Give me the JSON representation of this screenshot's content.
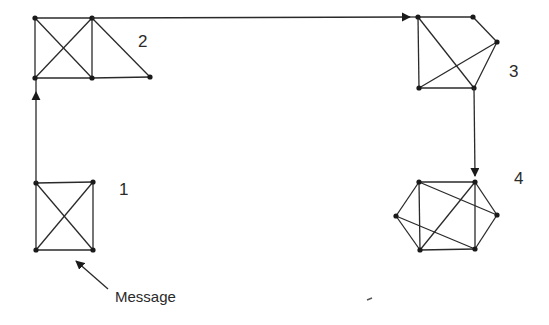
{
  "diagram": {
    "clusters": [
      {
        "id": "1",
        "label": "1",
        "label_pos": [
          119,
          181
        ]
      },
      {
        "id": "2",
        "label": "2",
        "label_pos": [
          138,
          33
        ]
      },
      {
        "id": "3",
        "label": "3",
        "label_pos": [
          509,
          63
        ]
      },
      {
        "id": "4",
        "label": "4",
        "label_pos": [
          514,
          170
        ]
      }
    ],
    "annotation": {
      "text": "Message",
      "pos": [
        115,
        288
      ]
    },
    "colors": {
      "line": "#2a2a2a",
      "node": "#1a1a1a",
      "background": "#ffffff"
    }
  }
}
